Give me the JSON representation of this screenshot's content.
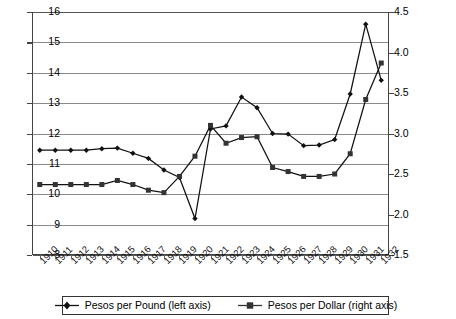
{
  "chart_data": {
    "type": "line",
    "title": "",
    "xlabel": "",
    "ylabel": "",
    "grid": true,
    "legend_position": "bottom",
    "x": [
      "1910",
      "1911",
      "1912",
      "1913",
      "1914",
      "1915",
      "1916",
      "1917",
      "1918",
      "1919",
      "1920",
      "1921",
      "1922",
      "1923",
      "1924",
      "1925",
      "1926",
      "1927",
      "1928",
      "1929",
      "1930",
      "1931",
      "1932"
    ],
    "left_axis": {
      "label": "Pesos per Pound (left axis)",
      "ylim": [
        8,
        16
      ],
      "ticks": [
        "8",
        "9",
        "10",
        "11",
        "12",
        "13",
        "14",
        "15",
        "16"
      ],
      "tick_step": 1
    },
    "right_axis": {
      "label": "Pesos per Dollar (right axis)",
      "ylim": [
        1.5,
        4.5
      ],
      "ticks": [
        "1.5",
        "2.0",
        "2.5",
        "3.0",
        "3.5",
        "4.0",
        "4.5"
      ],
      "tick_step": 0.5
    },
    "series": [
      {
        "name": "Pesos per Pound (left axis)",
        "axis": "left",
        "marker": "diamond",
        "color": "#111111",
        "values": [
          11.45,
          11.45,
          11.45,
          11.45,
          11.5,
          11.52,
          11.35,
          11.18,
          10.8,
          10.55,
          9.2,
          12.15,
          12.25,
          13.2,
          12.85,
          12.0,
          11.98,
          11.6,
          11.62,
          11.8,
          13.3,
          15.6,
          13.75
        ]
      },
      {
        "name": "Pesos per Dollar (right axis)",
        "axis": "right",
        "marker": "square",
        "color": "#333333",
        "values": [
          2.37,
          2.37,
          2.37,
          2.37,
          2.37,
          2.42,
          2.37,
          2.3,
          2.27,
          2.47,
          2.72,
          3.1,
          2.88,
          2.95,
          2.96,
          2.58,
          2.53,
          2.47,
          2.47,
          2.5,
          2.75,
          3.42,
          3.87
        ]
      }
    ]
  },
  "legend": {
    "entries": [
      {
        "label": "Pesos per Pound (left axis)",
        "marker": "diamond"
      },
      {
        "label": "Pesos per Dollar (right axis)",
        "marker": "square"
      }
    ]
  }
}
